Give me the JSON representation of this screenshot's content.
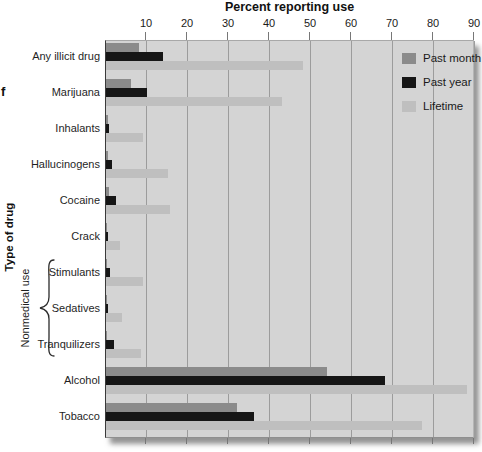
{
  "figure": {
    "stray_text": "f",
    "y_axis_label": "Type of drug",
    "nonmedical_group_label": "Nonmedical use"
  },
  "chart_data": {
    "type": "bar",
    "orientation": "horizontal",
    "title": "Percent reporting use",
    "xlabel": "Percent reporting use",
    "ylabel": "Type of drug",
    "xlim": [
      0,
      90
    ],
    "xticks": [
      10,
      20,
      30,
      40,
      50,
      60,
      70,
      80,
      90
    ],
    "grid": true,
    "legend_position": "top-right-inside",
    "plot_background": "#d4d4d4",
    "categories": [
      "Any illicit drug",
      "Marijuana",
      "Inhalants",
      "Hallucinogens",
      "Cocaine",
      "Crack",
      "Stimulants",
      "Sedatives",
      "Tranquilizers",
      "Alcohol",
      "Tobacco"
    ],
    "nonmedical_use_categories": [
      "Stimulants",
      "Sedatives",
      "Tranquilizers"
    ],
    "series": [
      {
        "name": "Past month",
        "color": "#8b8b8b",
        "values": [
          8,
          6,
          0.4,
          0.4,
          0.8,
          0.2,
          0.3,
          0.2,
          0.3,
          54,
          32
        ]
      },
      {
        "name": "Past year",
        "color": "#161616",
        "values": [
          14,
          10,
          0.8,
          1.5,
          2.5,
          0.6,
          0.9,
          0.4,
          2,
          68,
          36
        ]
      },
      {
        "name": "Lifetime",
        "color": "#bfbfbf",
        "values": [
          48,
          43,
          9,
          15,
          15.5,
          3.5,
          9,
          4,
          8.5,
          88,
          77
        ]
      }
    ]
  }
}
